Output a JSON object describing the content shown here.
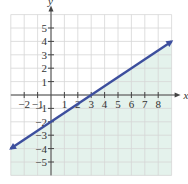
{
  "chart_data": {
    "type": "line",
    "title": "",
    "xlabel": "x",
    "ylabel": "y",
    "xlim": [
      -3,
      9
    ],
    "ylim": [
      -6,
      6
    ],
    "grid": true,
    "x_ticks": [
      "−2",
      "−1",
      "1",
      "2",
      "3",
      "4",
      "5",
      "6",
      "7",
      "8"
    ],
    "x_tick_values": [
      -2,
      -1,
      1,
      2,
      3,
      4,
      5,
      6,
      7,
      8
    ],
    "y_ticks": [
      "5",
      "4",
      "3",
      "2",
      "1",
      "−1",
      "−2",
      "−3",
      "−4",
      "−5"
    ],
    "y_tick_values": [
      5,
      4,
      3,
      2,
      1,
      -1,
      -2,
      -3,
      -4,
      -5
    ],
    "series": [
      {
        "name": "boundary line y = (2/3)x − 2",
        "x": [
          -3,
          0,
          3,
          9
        ],
        "y": [
          -4,
          -2,
          0,
          4
        ],
        "style": "solid",
        "arrows": "both"
      }
    ],
    "shaded_region": "below line (y ≤ (2/3)x − 2)",
    "colors": {
      "line": "#3d4f9e",
      "shade": "#e4f2ec",
      "grid": "#d6d6d6",
      "axis": "#444444"
    }
  }
}
